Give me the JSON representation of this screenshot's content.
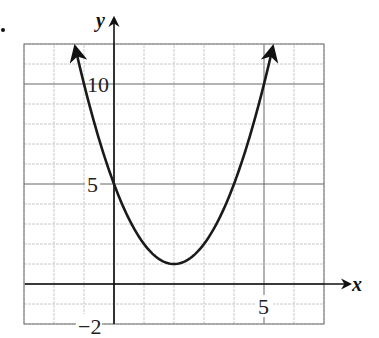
{
  "problem_marker": "•",
  "chart_data": {
    "type": "line",
    "title": "",
    "xlabel": "x",
    "ylabel": "y",
    "function": "y = (x - 2)^2 + 1",
    "xlim": [
      -3,
      7
    ],
    "ylim": [
      -2,
      12
    ],
    "grid": true,
    "x_tick_labels": [
      {
        "value": 5,
        "label": "5"
      }
    ],
    "y_tick_labels": [
      {
        "value": 10,
        "label": "10"
      },
      {
        "value": 5,
        "label": "5"
      },
      {
        "value": -2,
        "label": "−2"
      }
    ],
    "vertex": {
      "x": 2,
      "y": 1
    },
    "y_intercept": 5,
    "series": [
      {
        "name": "parabola",
        "x": [
          -1.29,
          -1,
          0,
          1,
          2,
          3,
          4,
          5,
          5.29
        ],
        "y": [
          11.8,
          10,
          5,
          2,
          1,
          2,
          5,
          10,
          11.8
        ]
      }
    ],
    "arrows_on_ends": true,
    "legend": null
  }
}
